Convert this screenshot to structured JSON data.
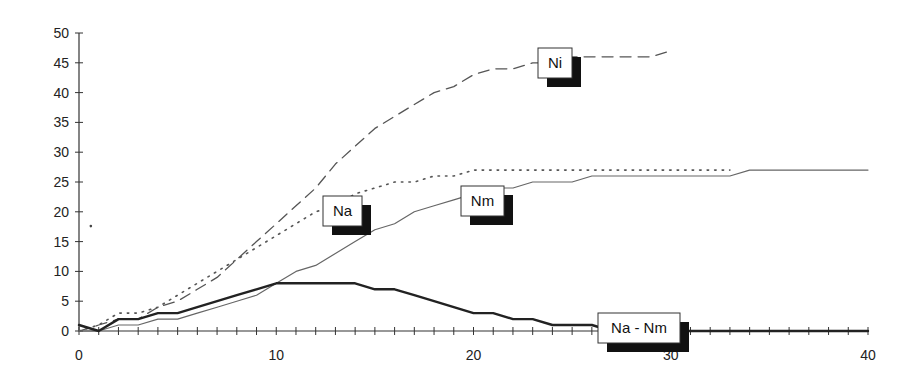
{
  "chart_data": {
    "type": "line",
    "title": "",
    "xlabel": "",
    "ylabel": "",
    "xlim": [
      0,
      40
    ],
    "ylim": [
      0,
      50
    ],
    "grid": false,
    "legend": "inline labeled boxes with drop shadows",
    "x_ticks": [
      0,
      10,
      20,
      30,
      40
    ],
    "x_ticks_minor_step": 1,
    "y_ticks": [
      0,
      5,
      10,
      15,
      20,
      25,
      30,
      35,
      40,
      45,
      50
    ],
    "series": [
      {
        "name": "Ni",
        "style": "dashed",
        "color": "#555555",
        "x": [
          0,
          1,
          2,
          3,
          4,
          5,
          6,
          7,
          8,
          9,
          10,
          11,
          12,
          13,
          14,
          15,
          16,
          17,
          18,
          19,
          20,
          21,
          22,
          23,
          24,
          25,
          26,
          27,
          28,
          29,
          30
        ],
        "values": [
          0,
          1,
          2,
          2,
          4,
          5,
          7,
          9,
          12,
          15,
          18,
          21,
          24,
          28,
          31,
          34,
          36,
          38,
          40,
          41,
          43,
          44,
          44,
          45,
          45,
          46,
          46,
          46,
          46,
          46,
          47
        ]
      },
      {
        "name": "Na",
        "style": "dotted",
        "color": "#555555",
        "x": [
          0,
          1,
          2,
          3,
          4,
          5,
          6,
          7,
          8,
          9,
          10,
          11,
          12,
          13,
          14,
          15,
          16,
          17,
          18,
          19,
          20,
          21,
          22,
          23,
          24,
          25,
          26,
          27,
          28,
          29,
          30,
          31,
          32,
          33
        ],
        "values": [
          0,
          1,
          3,
          3,
          4,
          6,
          8,
          10,
          12,
          14,
          16,
          18,
          20,
          21,
          23,
          24,
          25,
          25,
          26,
          26,
          27,
          27,
          27,
          27,
          27,
          27,
          27,
          27,
          27,
          27,
          27,
          27,
          27,
          27
        ]
      },
      {
        "name": "Nm",
        "style": "solid-thin",
        "color": "#666666",
        "x": [
          0,
          1,
          2,
          3,
          4,
          5,
          6,
          7,
          8,
          9,
          10,
          11,
          12,
          13,
          14,
          15,
          16,
          17,
          18,
          19,
          20,
          21,
          22,
          23,
          24,
          25,
          26,
          27,
          28,
          29,
          30,
          31,
          32,
          33,
          34,
          35,
          36,
          37,
          38,
          39,
          40
        ],
        "values": [
          0,
          0,
          1,
          1,
          2,
          2,
          3,
          4,
          5,
          6,
          8,
          10,
          11,
          13,
          15,
          17,
          18,
          20,
          21,
          22,
          23,
          24,
          24,
          25,
          25,
          25,
          26,
          26,
          26,
          26,
          26,
          26,
          26,
          26,
          27,
          27,
          27,
          27,
          27,
          27,
          27
        ]
      },
      {
        "name": "Na - Nm",
        "style": "solid-thick",
        "color": "#222222",
        "x": [
          0,
          1,
          2,
          3,
          4,
          5,
          6,
          7,
          8,
          9,
          10,
          11,
          12,
          13,
          14,
          15,
          16,
          17,
          18,
          19,
          20,
          21,
          22,
          23,
          24,
          25,
          26,
          27,
          28,
          29,
          30,
          31,
          32,
          33,
          34,
          35,
          36,
          37,
          38,
          39,
          40
        ],
        "values": [
          1,
          0,
          2,
          2,
          3,
          3,
          4,
          5,
          6,
          7,
          8,
          8,
          8,
          8,
          8,
          7,
          7,
          6,
          5,
          4,
          3,
          3,
          2,
          2,
          1,
          1,
          1,
          0,
          0,
          0,
          0,
          0,
          0,
          0,
          0,
          0,
          0,
          0,
          0,
          0,
          0
        ]
      }
    ],
    "labels": [
      {
        "series": "Ni",
        "text": "Ni",
        "box_x": 538,
        "box_y": 48,
        "box_w": 34,
        "box_h": 30
      },
      {
        "series": "Na",
        "text": "Na",
        "box_x": 323,
        "box_y": 196,
        "box_w": 39,
        "box_h": 30
      },
      {
        "series": "Nm",
        "text": "Nm",
        "box_x": 461,
        "box_y": 186,
        "box_w": 43,
        "box_h": 30
      },
      {
        "series": "Na - Nm",
        "text": "Na - Nm",
        "box_x": 598,
        "box_y": 313,
        "box_w": 82,
        "box_h": 30
      }
    ],
    "annotations": [
      {
        "type": "stray-dot",
        "x": 0.6,
        "y": 17.6
      }
    ]
  },
  "plot_area": {
    "x0_px": 79,
    "x1_px": 868,
    "y0_px": 331,
    "y1_px": 33
  },
  "colors": {
    "axis": "#333333",
    "background": "#ffffff",
    "shadow": "#111111",
    "label_box": "#ffffff"
  }
}
